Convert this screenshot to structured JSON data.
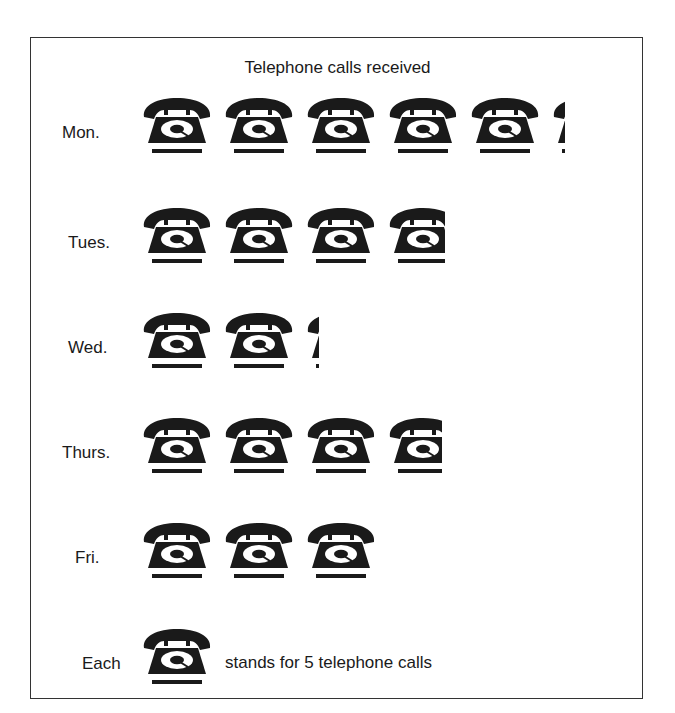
{
  "chart_data": {
    "type": "pictogram",
    "title": "Telephone calls received",
    "categories": [
      "Mon.",
      "Tues.",
      "Wed.",
      "Thurs.",
      "Fri."
    ],
    "icon_counts": [
      5.2,
      3.8,
      2.2,
      3.75,
      3
    ],
    "values": [
      26,
      19,
      11,
      19,
      15
    ],
    "unit": "telephone calls",
    "icon": "telephone-icon",
    "icon_value": 5,
    "legend": "Each [telephone] stands for 5 telephone calls"
  },
  "title": "Telephone calls received",
  "rows": [
    {
      "label": "Mon.",
      "icons": 5.2
    },
    {
      "label": "Tues.",
      "icons": 3.8
    },
    {
      "label": "Wed.",
      "icons": 2.2
    },
    {
      "label": "Thurs.",
      "icons": 3.75
    },
    {
      "label": "Fri.",
      "icons": 3
    }
  ],
  "legend": {
    "prefix": "Each",
    "suffix": "stands for 5 telephone calls"
  },
  "colors": {
    "ink": "#1a1a1a",
    "background": "#ffffff"
  }
}
